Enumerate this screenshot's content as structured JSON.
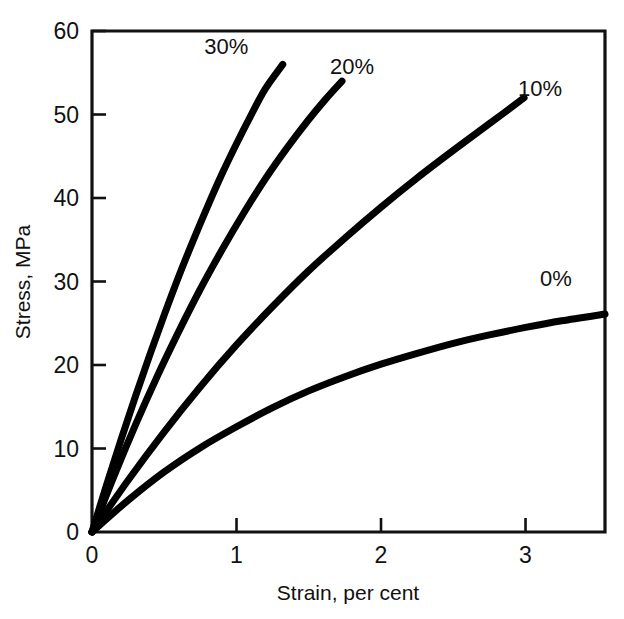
{
  "chart_data": {
    "type": "line",
    "title": "",
    "xlabel": "Strain, per cent",
    "ylabel": "Stress, MPa",
    "xlim": [
      0,
      3.55
    ],
    "ylim": [
      0,
      60
    ],
    "xticks": [
      0,
      1,
      2,
      3
    ],
    "xtick_labels": [
      "0",
      "1",
      "2",
      "3"
    ],
    "yticks": [
      0,
      10,
      20,
      30,
      40,
      50,
      60
    ],
    "ytick_labels": [
      "0",
      "10",
      "20",
      "30",
      "40",
      "50",
      "60"
    ],
    "grid": false,
    "legend": "inline-curve-labels",
    "series": [
      {
        "name": "30%",
        "label": "30%",
        "label_x": 0.93,
        "label_y": 57.2,
        "color": "#000000",
        "x": [
          0.0,
          0.1,
          0.2,
          0.3,
          0.4,
          0.5,
          0.6,
          0.7,
          0.8,
          0.9,
          1.0,
          1.1,
          1.2,
          1.32
        ],
        "y": [
          0.0,
          5.6,
          11.0,
          16.2,
          21.2,
          26.0,
          30.6,
          34.9,
          39.0,
          42.9,
          46.5,
          49.9,
          53.1,
          56.0
        ]
      },
      {
        "name": "20%",
        "label": "20%",
        "label_x": 1.8,
        "label_y": 54.8,
        "color": "#000000",
        "x": [
          0.0,
          0.15,
          0.3,
          0.45,
          0.6,
          0.75,
          0.9,
          1.05,
          1.2,
          1.35,
          1.5,
          1.62,
          1.73
        ],
        "y": [
          0.0,
          6.6,
          12.8,
          18.6,
          24.0,
          29.1,
          33.8,
          38.2,
          42.3,
          46.0,
          49.4,
          51.9,
          54.0
        ]
      },
      {
        "name": "10%",
        "label": "10%",
        "label_x": 3.1,
        "label_y": 52.2,
        "color": "#000000",
        "x": [
          0.0,
          0.25,
          0.5,
          0.75,
          1.0,
          1.25,
          1.5,
          1.75,
          2.0,
          2.25,
          2.5,
          2.75,
          2.99
        ],
        "y": [
          0.0,
          6.2,
          12.0,
          17.4,
          22.4,
          27.0,
          31.3,
          35.2,
          38.9,
          42.4,
          45.7,
          48.9,
          52.0
        ]
      },
      {
        "name": "0%",
        "label": "0%",
        "label_x": 3.21,
        "label_y": 29.5,
        "color": "#000000",
        "x": [
          0.0,
          0.25,
          0.5,
          0.75,
          1.0,
          1.25,
          1.5,
          1.75,
          2.0,
          2.25,
          2.5,
          2.75,
          3.0,
          3.25,
          3.55
        ],
        "y": [
          0.0,
          3.8,
          7.2,
          10.1,
          12.6,
          14.9,
          16.9,
          18.6,
          20.1,
          21.4,
          22.6,
          23.6,
          24.5,
          25.3,
          26.1
        ]
      }
    ]
  },
  "axes": {
    "x_axis_title": "Strain, per cent",
    "y_axis_title": "Stress, MPa"
  }
}
